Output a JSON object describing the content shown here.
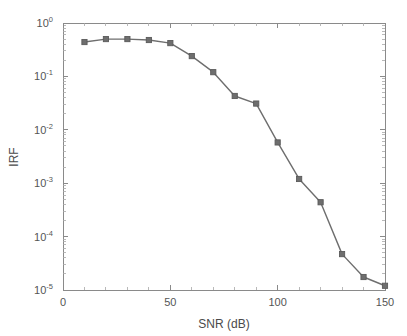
{
  "chart_data": {
    "type": "line",
    "title": "",
    "subtitle": "",
    "xlabel": "SNR (dB)",
    "ylabel": "IRF",
    "yscale": "log",
    "xscale": "linear",
    "xlim": [
      0,
      150
    ],
    "ylim": [
      1e-05,
      1
    ],
    "grid": false,
    "legend": null,
    "legend_position": "none",
    "xticks": [
      0,
      50,
      100,
      150
    ],
    "xticklabels": [
      "0",
      "50",
      "100",
      "150"
    ],
    "yticks": [
      1,
      0.1,
      0.01,
      0.001,
      0.0001,
      1e-05
    ],
    "yticklabels": [
      "10^0",
      "10^-1",
      "10^-2",
      "10^-3",
      "10^-4",
      "10^-5"
    ],
    "ytick_mantissa": [
      "10",
      "10",
      "10",
      "10",
      "10",
      "10"
    ],
    "ytick_exponents": [
      "0",
      "-1",
      "-2",
      "-3",
      "-4",
      "-5"
    ],
    "series": [
      {
        "name": "IRF",
        "color": "#6e6e6e",
        "marker": "square",
        "x": [
          10,
          20,
          30,
          40,
          50,
          60,
          70,
          80,
          90,
          100,
          110,
          120,
          130,
          140,
          150
        ],
        "values": [
          0.44,
          0.5,
          0.5,
          0.48,
          0.42,
          0.24,
          0.12,
          0.043,
          0.031,
          0.0058,
          0.0012,
          0.00044,
          4.7e-05,
          1.75e-05,
          1.2e-05
        ]
      }
    ]
  },
  "figure": {
    "background_color": "#ffffff",
    "axis_color": "#8a8a8a",
    "text_color": "#555555",
    "line_color": "#6e6e6e"
  }
}
